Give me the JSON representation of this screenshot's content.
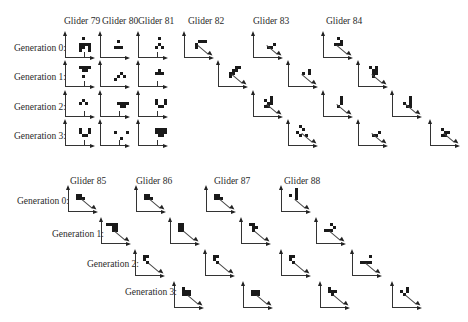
{
  "figure": {
    "top_section": {
      "glider_headers": [
        {
          "label": "Glider 79",
          "x": 64,
          "y": 16
        },
        {
          "label": "Glider 80",
          "x": 102,
          "y": 16
        },
        {
          "label": "Glider 81",
          "x": 138,
          "y": 16
        },
        {
          "label": "Glider 82",
          "x": 188,
          "y": 16
        },
        {
          "label": "Glider 83",
          "x": 253,
          "y": 16
        },
        {
          "label": "Glider 84",
          "x": 326,
          "y": 16
        }
      ],
      "generation_labels": [
        {
          "label": "Generation 0:",
          "x": 14,
          "y": 43
        },
        {
          "label": "Generation 1:",
          "x": 14,
          "y": 72
        },
        {
          "label": "Generation 2:",
          "x": 14,
          "y": 102
        },
        {
          "label": "Generation 3:",
          "x": 14,
          "y": 131
        }
      ]
    },
    "bottom_section": {
      "glider_headers": [
        {
          "label": "Glider 85",
          "x": 70,
          "y": 176
        },
        {
          "label": "Glider 86",
          "x": 136,
          "y": 176
        },
        {
          "label": "Glider 87",
          "x": 214,
          "y": 176
        },
        {
          "label": "Glider 88",
          "x": 284,
          "y": 176
        }
      ],
      "generation_labels": [
        {
          "label": "Generation 0:",
          "x": 17,
          "y": 196
        },
        {
          "label": "Generation 1:",
          "x": 52,
          "y": 229
        },
        {
          "label": "Generation 2:",
          "x": 87,
          "y": 259
        },
        {
          "label": "Generation 3:",
          "x": 125,
          "y": 287
        }
      ]
    },
    "panels": [
      {
        "glider": "79",
        "gen": 0,
        "x": 65,
        "y": 32,
        "dir": "down",
        "cells": [
          [
            5,
            1
          ],
          [
            4,
            3
          ],
          [
            5,
            3
          ],
          [
            6,
            3
          ],
          [
            7,
            3
          ],
          [
            4,
            4
          ],
          [
            5,
            4
          ],
          [
            7,
            4
          ],
          [
            4,
            5
          ],
          [
            7,
            5
          ]
        ]
      },
      {
        "glider": "80",
        "gen": 0,
        "x": 100,
        "y": 32,
        "dir": "none",
        "cells": [
          [
            5,
            2
          ],
          [
            4,
            4
          ],
          [
            5,
            4
          ],
          [
            6,
            4
          ]
        ]
      },
      {
        "glider": "81",
        "gen": 0,
        "x": 138,
        "y": 32,
        "dir": "down",
        "cells": [
          [
            6,
            1
          ],
          [
            6,
            3
          ],
          [
            5,
            4
          ],
          [
            7,
            4
          ]
        ]
      },
      {
        "glider": "82",
        "gen": 0,
        "x": 184,
        "y": 32,
        "dir": "diag",
        "cells": [
          [
            4,
            2
          ],
          [
            5,
            2
          ],
          [
            6,
            2
          ],
          [
            3,
            3
          ],
          [
            3,
            4
          ]
        ]
      },
      {
        "glider": "83",
        "gen": 0,
        "x": 253,
        "y": 32,
        "dir": "diag",
        "cells": [
          [
            6,
            3
          ],
          [
            4,
            4
          ],
          [
            5,
            4
          ]
        ]
      },
      {
        "glider": "84",
        "gen": 0,
        "x": 323,
        "y": 32,
        "dir": "diag",
        "cells": [
          [
            4,
            1
          ],
          [
            5,
            2
          ],
          [
            3,
            3
          ],
          [
            4,
            3
          ],
          [
            5,
            3
          ]
        ]
      },
      {
        "glider": "79",
        "gen": 1,
        "x": 65,
        "y": 61,
        "dir": "down",
        "cells": [
          [
            4,
            1
          ],
          [
            5,
            1
          ],
          [
            6,
            1
          ],
          [
            7,
            1
          ],
          [
            5,
            2
          ],
          [
            6,
            2
          ],
          [
            5,
            4
          ]
        ]
      },
      {
        "glider": "80",
        "gen": 1,
        "x": 100,
        "y": 61,
        "dir": "none",
        "cells": [
          [
            6,
            3
          ],
          [
            5,
            4
          ],
          [
            7,
            4
          ],
          [
            4,
            5
          ]
        ]
      },
      {
        "glider": "81",
        "gen": 1,
        "x": 138,
        "y": 61,
        "dir": "down",
        "cells": [
          [
            6,
            2
          ],
          [
            5,
            3
          ],
          [
            6,
            3
          ],
          [
            7,
            3
          ]
        ]
      },
      {
        "glider": "82",
        "gen": 1,
        "x": 218,
        "y": 61,
        "dir": "diag",
        "cells": [
          [
            5,
            1
          ],
          [
            6,
            1
          ],
          [
            4,
            2
          ],
          [
            5,
            2
          ],
          [
            3,
            3
          ],
          [
            4,
            3
          ],
          [
            3,
            4
          ]
        ]
      },
      {
        "glider": "83",
        "gen": 1,
        "x": 288,
        "y": 61,
        "dir": "diag",
        "cells": [
          [
            6,
            2
          ],
          [
            6,
            3
          ],
          [
            4,
            3
          ]
        ]
      },
      {
        "glider": "84",
        "gen": 1,
        "x": 358,
        "y": 61,
        "dir": "diag",
        "cells": [
          [
            3,
            1
          ],
          [
            4,
            2
          ],
          [
            5,
            1
          ],
          [
            5,
            2
          ],
          [
            4,
            3
          ],
          [
            5,
            3
          ],
          [
            4,
            4
          ]
        ]
      },
      {
        "glider": "79",
        "gen": 2,
        "x": 65,
        "y": 91,
        "dir": "down",
        "cells": [
          [
            5,
            2
          ],
          [
            4,
            3
          ],
          [
            6,
            3
          ]
        ]
      },
      {
        "glider": "80",
        "gen": 2,
        "x": 100,
        "y": 91,
        "dir": "down",
        "cells": [
          [
            5,
            3
          ],
          [
            6,
            3
          ],
          [
            7,
            3
          ],
          [
            8,
            3
          ],
          [
            6,
            4
          ],
          [
            7,
            4
          ]
        ]
      },
      {
        "glider": "81",
        "gen": 2,
        "x": 138,
        "y": 91,
        "dir": "down",
        "cells": [
          [
            5,
            2
          ],
          [
            8,
            2
          ],
          [
            5,
            3
          ],
          [
            8,
            3
          ],
          [
            6,
            4
          ],
          [
            7,
            4
          ]
        ]
      },
      {
        "glider": "82",
        "gen": 2,
        "x": 253,
        "y": 91,
        "dir": "diag",
        "cells": [
          [
            5,
            1
          ],
          [
            3,
            2
          ],
          [
            5,
            2
          ],
          [
            4,
            3
          ],
          [
            5,
            3
          ],
          [
            3,
            4
          ],
          [
            4,
            4
          ]
        ]
      },
      {
        "glider": "83",
        "gen": 2,
        "x": 323,
        "y": 91,
        "dir": "diag",
        "cells": [
          [
            5,
            1
          ],
          [
            5,
            2
          ],
          [
            5,
            3
          ],
          [
            4,
            4
          ]
        ]
      },
      {
        "glider": "84",
        "gen": 2,
        "x": 392,
        "y": 91,
        "dir": "diag",
        "cells": [
          [
            5,
            1
          ],
          [
            5,
            2
          ],
          [
            3,
            3
          ],
          [
            5,
            3
          ],
          [
            4,
            4
          ],
          [
            5,
            4
          ]
        ]
      },
      {
        "glider": "79",
        "gen": 3,
        "x": 65,
        "y": 120,
        "dir": "down",
        "cells": [
          [
            4,
            2
          ],
          [
            7,
            2
          ],
          [
            4,
            3
          ],
          [
            7,
            3
          ],
          [
            5,
            4
          ],
          [
            6,
            4
          ]
        ]
      },
      {
        "glider": "80",
        "gen": 3,
        "x": 100,
        "y": 120,
        "dir": "down",
        "cells": [
          [
            4,
            3
          ],
          [
            8,
            3
          ],
          [
            6,
            5
          ]
        ]
      },
      {
        "glider": "81",
        "gen": 3,
        "x": 138,
        "y": 120,
        "dir": "down",
        "cells": [
          [
            5,
            2
          ],
          [
            6,
            2
          ],
          [
            7,
            2
          ],
          [
            8,
            2
          ],
          [
            5,
            3
          ],
          [
            6,
            3
          ],
          [
            7,
            3
          ],
          [
            8,
            3
          ],
          [
            6,
            4
          ],
          [
            7,
            4
          ]
        ]
      },
      {
        "glider": "82",
        "gen": 3,
        "x": 288,
        "y": 120,
        "dir": "diag",
        "cells": [
          [
            3,
            1
          ],
          [
            4,
            2
          ],
          [
            2,
            3
          ],
          [
            3,
            4
          ],
          [
            5,
            4
          ]
        ]
      },
      {
        "glider": "83",
        "gen": 3,
        "x": 358,
        "y": 120,
        "dir": "diag",
        "cells": [
          [
            6,
            3
          ],
          [
            4,
            4
          ],
          [
            5,
            4
          ]
        ]
      },
      {
        "glider": "84",
        "gen": 3,
        "x": 430,
        "y": 120,
        "dir": "diag",
        "cells": [
          [
            3,
            2
          ],
          [
            4,
            3
          ],
          [
            5,
            3
          ],
          [
            3,
            4
          ],
          [
            4,
            4
          ]
        ]
      },
      {
        "glider": "85",
        "gen": 0,
        "x": 68,
        "y": 186,
        "dir": "diag",
        "cells": [
          [
            2,
            2
          ],
          [
            3,
            2
          ],
          [
            2,
            3
          ],
          [
            3,
            3
          ],
          [
            4,
            3
          ]
        ]
      },
      {
        "glider": "86",
        "gen": 0,
        "x": 136,
        "y": 186,
        "dir": "diag",
        "cells": [
          [
            2,
            2
          ],
          [
            3,
            2
          ],
          [
            2,
            3
          ],
          [
            3,
            3
          ],
          [
            4,
            3
          ]
        ]
      },
      {
        "glider": "87",
        "gen": 0,
        "x": 206,
        "y": 186,
        "dir": "diag",
        "cells": [
          [
            2,
            2
          ],
          [
            3,
            2
          ],
          [
            2,
            3
          ],
          [
            3,
            3
          ],
          [
            4,
            3
          ]
        ]
      },
      {
        "glider": "88",
        "gen": 0,
        "x": 281,
        "y": 186,
        "dir": "diag",
        "cells": [
          [
            4,
            0
          ],
          [
            4,
            1
          ],
          [
            4,
            2
          ],
          [
            4,
            3
          ],
          [
            2,
            2
          ]
        ]
      },
      {
        "glider": "85",
        "gen": 1,
        "x": 101,
        "y": 218,
        "dir": "diag",
        "cells": [
          [
            1,
            1
          ],
          [
            2,
            1
          ],
          [
            3,
            1
          ],
          [
            4,
            1
          ],
          [
            3,
            2
          ],
          [
            4,
            2
          ],
          [
            3,
            3
          ],
          [
            4,
            3
          ]
        ]
      },
      {
        "glider": "86",
        "gen": 1,
        "x": 170,
        "y": 218,
        "dir": "diag",
        "cells": [
          [
            2,
            1
          ],
          [
            3,
            1
          ],
          [
            2,
            2
          ],
          [
            3,
            2
          ],
          [
            2,
            3
          ],
          [
            3,
            3
          ]
        ]
      },
      {
        "glider": "87",
        "gen": 1,
        "x": 241,
        "y": 218,
        "dir": "diag",
        "cells": [
          [
            2,
            1
          ],
          [
            3,
            1
          ],
          [
            3,
            2
          ],
          [
            4,
            2
          ],
          [
            3,
            3
          ]
        ]
      },
      {
        "glider": "88",
        "gen": 1,
        "x": 316,
        "y": 218,
        "dir": "diag",
        "cells": [
          [
            4,
            1
          ],
          [
            5,
            2
          ],
          [
            2,
            3
          ],
          [
            3,
            3
          ],
          [
            4,
            3
          ]
        ]
      },
      {
        "glider": "85",
        "gen": 2,
        "x": 135,
        "y": 250,
        "dir": "diag",
        "cells": [
          [
            2,
            1
          ],
          [
            3,
            1
          ],
          [
            2,
            2
          ],
          [
            3,
            3
          ]
        ]
      },
      {
        "glider": "86",
        "gen": 2,
        "x": 205,
        "y": 250,
        "dir": "diag",
        "cells": [
          [
            2,
            1
          ],
          [
            3,
            1
          ],
          [
            2,
            2
          ],
          [
            3,
            3
          ]
        ]
      },
      {
        "glider": "87",
        "gen": 2,
        "x": 281,
        "y": 250,
        "dir": "diag",
        "cells": [
          [
            2,
            1
          ],
          [
            3,
            1
          ],
          [
            2,
            2
          ],
          [
            3,
            3
          ]
        ]
      },
      {
        "glider": "88",
        "gen": 2,
        "x": 352,
        "y": 250,
        "dir": "diag",
        "cells": [
          [
            5,
            1
          ],
          [
            2,
            3
          ],
          [
            3,
            3
          ],
          [
            4,
            3
          ],
          [
            5,
            3
          ]
        ]
      },
      {
        "glider": "85",
        "gen": 3,
        "x": 174,
        "y": 282,
        "dir": "diag",
        "cells": [
          [
            2,
            1
          ],
          [
            2,
            2
          ],
          [
            3,
            2
          ],
          [
            4,
            2
          ],
          [
            2,
            3
          ],
          [
            3,
            3
          ],
          [
            4,
            3
          ]
        ]
      },
      {
        "glider": "86",
        "gen": 3,
        "x": 243,
        "y": 282,
        "dir": "diag",
        "cells": [
          [
            2,
            2
          ],
          [
            3,
            2
          ],
          [
            4,
            2
          ],
          [
            2,
            3
          ],
          [
            3,
            3
          ],
          [
            4,
            3
          ]
        ]
      },
      {
        "glider": "87",
        "gen": 3,
        "x": 320,
        "y": 282,
        "dir": "diag",
        "cells": [
          [
            2,
            1
          ],
          [
            2,
            2
          ],
          [
            3,
            2
          ],
          [
            4,
            2
          ],
          [
            3,
            3
          ]
        ]
      },
      {
        "glider": "88",
        "gen": 3,
        "x": 392,
        "y": 282,
        "dir": "diag",
        "cells": [
          [
            4,
            1
          ],
          [
            2,
            2
          ],
          [
            4,
            2
          ],
          [
            3,
            3
          ]
        ]
      }
    ]
  }
}
